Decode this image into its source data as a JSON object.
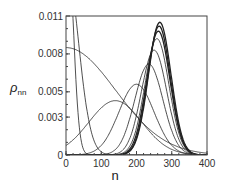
{
  "chart_data": {
    "type": "line",
    "title": "",
    "xlabel": "n",
    "ylabel": "ρnn",
    "xlim": [
      0,
      400
    ],
    "ylim": [
      0,
      0.011
    ],
    "xticks": [
      "0",
      "100",
      "200",
      "300",
      "400"
    ],
    "yticks": [
      "0",
      "0.003",
      "0.005",
      "0.008",
      "0.011"
    ],
    "grid": false,
    "legend": null,
    "series": [
      {
        "name": "curve-1",
        "peak_x": 0,
        "peak_y": 0.02,
        "width": 18
      },
      {
        "name": "curve-2",
        "peak_x": 0,
        "peak_y": 0.015,
        "width": 35
      },
      {
        "name": "curve-3",
        "peak_x": 0,
        "peak_y": 0.0085,
        "width": 140
      },
      {
        "name": "curve-4",
        "peak_x": 140,
        "peak_y": 0.0043,
        "width": 75
      },
      {
        "name": "curve-5",
        "peak_x": 200,
        "peak_y": 0.0056,
        "width": 50
      },
      {
        "name": "curve-6",
        "peak_x": 235,
        "peak_y": 0.0072,
        "width": 40
      },
      {
        "name": "curve-7",
        "peak_x": 250,
        "peak_y": 0.0083,
        "width": 36
      },
      {
        "name": "curve-8",
        "peak_x": 258,
        "peak_y": 0.0092,
        "width": 34
      },
      {
        "name": "curve-9",
        "peak_x": 262,
        "peak_y": 0.0098,
        "width": 33
      },
      {
        "name": "curve-10",
        "peak_x": 264,
        "peak_y": 0.0102,
        "width": 32
      },
      {
        "name": "curve-11",
        "peak_x": 266,
        "peak_y": 0.0105,
        "width": 32
      }
    ]
  }
}
